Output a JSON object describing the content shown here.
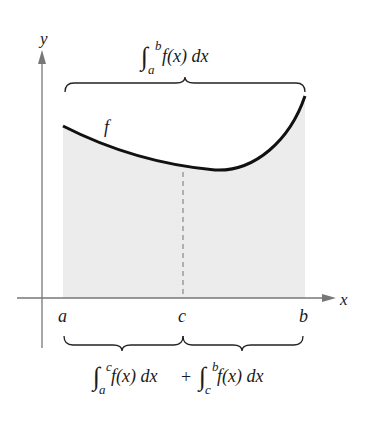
{
  "diagram": {
    "axes": {
      "x_label": "x",
      "y_label": "y"
    },
    "points": {
      "a": "a",
      "c": "c",
      "b": "b"
    },
    "curve_label": "f",
    "top_integral": {
      "lower": "a",
      "upper": "b",
      "integrand": "f(x) dx"
    },
    "bottom_integral_left": {
      "lower": "a",
      "upper": "c",
      "integrand": "f(x) dx"
    },
    "plus": "+",
    "bottom_integral_right": {
      "lower": "c",
      "upper": "b",
      "integrand": "f(x) dx"
    },
    "colors": {
      "shade": "#ececec",
      "curve": "#111111",
      "axis": "#777777",
      "dash": "#888888"
    }
  }
}
